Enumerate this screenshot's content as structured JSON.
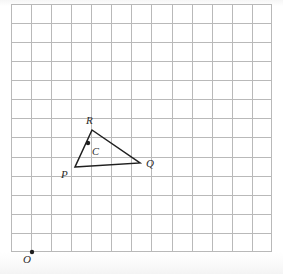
{
  "figure": {
    "background_color": "#ffffff",
    "grid": {
      "line_color": "#b9b9b9",
      "cell_width": 20.07,
      "cell_height": 19.07,
      "columns": 13,
      "rows": 13,
      "left": 11,
      "top": 4,
      "width": 261,
      "height": 248
    },
    "shape": {
      "name": "triangle-pqr",
      "stroke_color": "#1f1f1f",
      "stroke_width": 1.5,
      "fill": "none",
      "vertices": [
        {
          "label": "P",
          "x": 75,
          "y": 167
        },
        {
          "label": "Q",
          "x": 140,
          "y": 163
        },
        {
          "label": "R",
          "x": 92,
          "y": 130
        }
      ]
    },
    "points": [
      {
        "label": "C",
        "x": 88,
        "y": 143,
        "radius": 2.2,
        "color": "#1f1f1f"
      },
      {
        "label": "O",
        "x": 32,
        "y": 252,
        "radius": 2.2,
        "color": "#1f1f1f"
      }
    ],
    "labels": [
      {
        "name": "vertex-label-r",
        "text": "R",
        "x": 86,
        "y": 115
      },
      {
        "name": "vertex-label-p",
        "text": "P",
        "x": 61,
        "y": 169
      },
      {
        "name": "vertex-label-q",
        "text": "Q",
        "x": 146,
        "y": 158
      },
      {
        "name": "point-label-c",
        "text": "C",
        "x": 92,
        "y": 146
      },
      {
        "name": "origin-label-o",
        "text": "O",
        "x": 23,
        "y": 254
      }
    ]
  }
}
